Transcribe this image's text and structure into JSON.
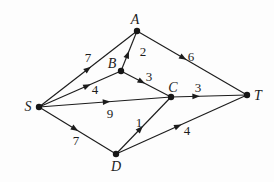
{
  "figure": {
    "kind": "directed-weighted-graph",
    "background": "#fdfdfd",
    "ink": "#1c1c1c",
    "width": 274,
    "height": 182,
    "node_radius": 3.2,
    "nodes": [
      {
        "id": "S",
        "label": "S",
        "x": 39,
        "y": 107,
        "lx": 28,
        "ly": 111
      },
      {
        "id": "A",
        "label": "A",
        "x": 137,
        "y": 31,
        "lx": 135,
        "ly": 24
      },
      {
        "id": "B",
        "label": "B",
        "x": 121,
        "y": 71,
        "lx": 112,
        "ly": 68
      },
      {
        "id": "C",
        "label": "C",
        "x": 171,
        "y": 97,
        "lx": 173,
        "ly": 92
      },
      {
        "id": "D",
        "label": "D",
        "x": 116,
        "y": 154,
        "lx": 116,
        "ly": 171
      },
      {
        "id": "T",
        "label": "T",
        "x": 247,
        "y": 95,
        "lx": 258,
        "ly": 100
      }
    ],
    "edges": [
      {
        "from": "S",
        "to": "A",
        "weight": "7",
        "wx": 88,
        "wy": 62,
        "t": 0.53
      },
      {
        "from": "S",
        "to": "B",
        "weight": "4",
        "wx": 95,
        "wy": 94,
        "t": 0.63
      },
      {
        "from": "S",
        "to": "C",
        "weight": "9",
        "wx": 110,
        "wy": 118,
        "t": 0.54
      },
      {
        "from": "S",
        "to": "D",
        "weight": "7",
        "wx": 76,
        "wy": 145,
        "t": 0.51
      },
      {
        "from": "B",
        "to": "A",
        "weight": "2",
        "wx": 143,
        "wy": 56,
        "t": 0.5
      },
      {
        "from": "A",
        "to": "T",
        "weight": "6",
        "wx": 191,
        "wy": 61,
        "t": 0.45
      },
      {
        "from": "B",
        "to": "C",
        "weight": "3",
        "wx": 149,
        "wy": 81,
        "t": 0.48
      },
      {
        "from": "C",
        "to": "T",
        "weight": "3",
        "wx": 198,
        "wy": 92,
        "t": 0.38
      },
      {
        "from": "D",
        "to": "C",
        "weight": "1",
        "wx": 139,
        "wy": 127,
        "t": 0.49
      },
      {
        "from": "D",
        "to": "T",
        "weight": "4",
        "wx": 187,
        "wy": 135,
        "t": 0.5
      }
    ],
    "arrow": {
      "length": 7.5,
      "half_width": 2.9
    }
  },
  "chart_data": {
    "type": "table",
    "title": "",
    "nodes": [
      "S",
      "A",
      "B",
      "C",
      "D",
      "T"
    ],
    "edges": [
      {
        "from": "S",
        "to": "A",
        "weight": 7
      },
      {
        "from": "S",
        "to": "B",
        "weight": 4
      },
      {
        "from": "S",
        "to": "C",
        "weight": 9
      },
      {
        "from": "S",
        "to": "D",
        "weight": 7
      },
      {
        "from": "B",
        "to": "A",
        "weight": 2
      },
      {
        "from": "A",
        "to": "T",
        "weight": 6
      },
      {
        "from": "B",
        "to": "C",
        "weight": 3
      },
      {
        "from": "C",
        "to": "T",
        "weight": 3
      },
      {
        "from": "D",
        "to": "C",
        "weight": 1
      },
      {
        "from": "D",
        "to": "T",
        "weight": 4
      }
    ]
  }
}
